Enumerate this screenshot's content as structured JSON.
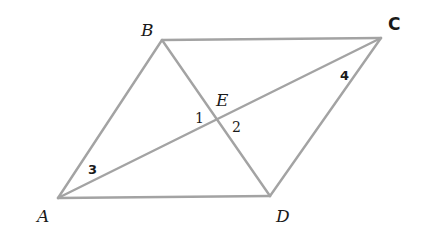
{
  "figure": {
    "type": "parallelogram-with-diagonals",
    "line_color": "#a3a3a3",
    "label_color": "#1a1a1a",
    "vertices": {
      "A": {
        "label": "A",
        "x": 58,
        "y": 198
      },
      "B": {
        "label": "B",
        "x": 162,
        "y": 40
      },
      "C": {
        "label": "C",
        "x": 381,
        "y": 38
      },
      "D": {
        "label": "D",
        "x": 270,
        "y": 196
      }
    },
    "intersection": {
      "label": "E",
      "x": 219,
      "y": 118
    },
    "sides": [
      "AB",
      "BC",
      "CD",
      "DA"
    ],
    "diagonals": [
      "AC",
      "BD"
    ],
    "angles": [
      {
        "label": "1",
        "at": "E"
      },
      {
        "label": "2",
        "at": "E"
      },
      {
        "label": "3",
        "at": "A"
      },
      {
        "label": "4",
        "at": "C"
      }
    ]
  }
}
